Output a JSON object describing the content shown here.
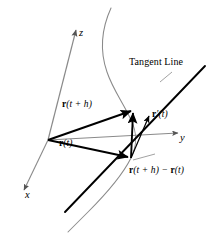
{
  "figure": {
    "background_color": "#ffffff",
    "width": 217,
    "height": 234
  },
  "colors": {
    "curve": "#8a8a8a",
    "axis": "#8a8a8a",
    "vector": "#000000",
    "tangent_line": "#000000",
    "leader": "#8a8a8a",
    "text": "#000000"
  },
  "axes": {
    "z": {
      "label": "z",
      "direction": "up",
      "arrowhead": true,
      "origin": [
        48,
        140
      ],
      "tip": [
        76,
        27
      ]
    },
    "y": {
      "label": "y",
      "direction": "right",
      "arrowhead": true,
      "origin": [
        48,
        140
      ],
      "tip": [
        183,
        133
      ]
    },
    "x": {
      "label": "x",
      "direction": "down-left",
      "arrowhead": true,
      "origin": [
        48,
        140
      ],
      "tip": [
        22,
        193
      ]
    }
  },
  "curve": {
    "name": "space-curve",
    "style": "thin gray S-shaped curve",
    "stroke": "#8a8a8a"
  },
  "tangent_line": {
    "label": "Tangent Line",
    "style": "thick black straight line through the point r(t)",
    "stroke": "#000000"
  },
  "vectors": [
    {
      "id": "r-t-plus-h",
      "label_bold": "r",
      "label_rest": "(t + h)",
      "label_plain": "r(t + h)",
      "description": "position vector from origin to the point at parameter t + h",
      "from": [
        48,
        140
      ],
      "to": [
        133,
        110
      ]
    },
    {
      "id": "r-t",
      "label_bold": "r",
      "label_rest": "(t)",
      "label_plain": "r(t)",
      "description": "position vector from origin to the point at parameter t",
      "from": [
        48,
        140
      ],
      "to": [
        131,
        158
      ]
    },
    {
      "id": "secant-difference",
      "label_bold_1": "r",
      "label_mid": "(t + h) − ",
      "label_bold_2": "r",
      "label_end": "(t)",
      "label_plain": "r(t + h) − r(t)",
      "description": "secant (difference) vector from the point at t to the point at t + h",
      "from": [
        131,
        158
      ],
      "to": [
        133,
        110
      ]
    },
    {
      "id": "derivative",
      "label_bold": "r",
      "label_rest": "′(t)",
      "label_plain": "r′(t)",
      "description": "tangent (derivative) vector along the tangent line",
      "from": [
        131,
        158
      ],
      "to": [
        151,
        112
      ]
    }
  ],
  "labels": {
    "tangent_line": "Tangent Line",
    "axis_z": "z",
    "axis_y": "y",
    "axis_x": "x"
  }
}
